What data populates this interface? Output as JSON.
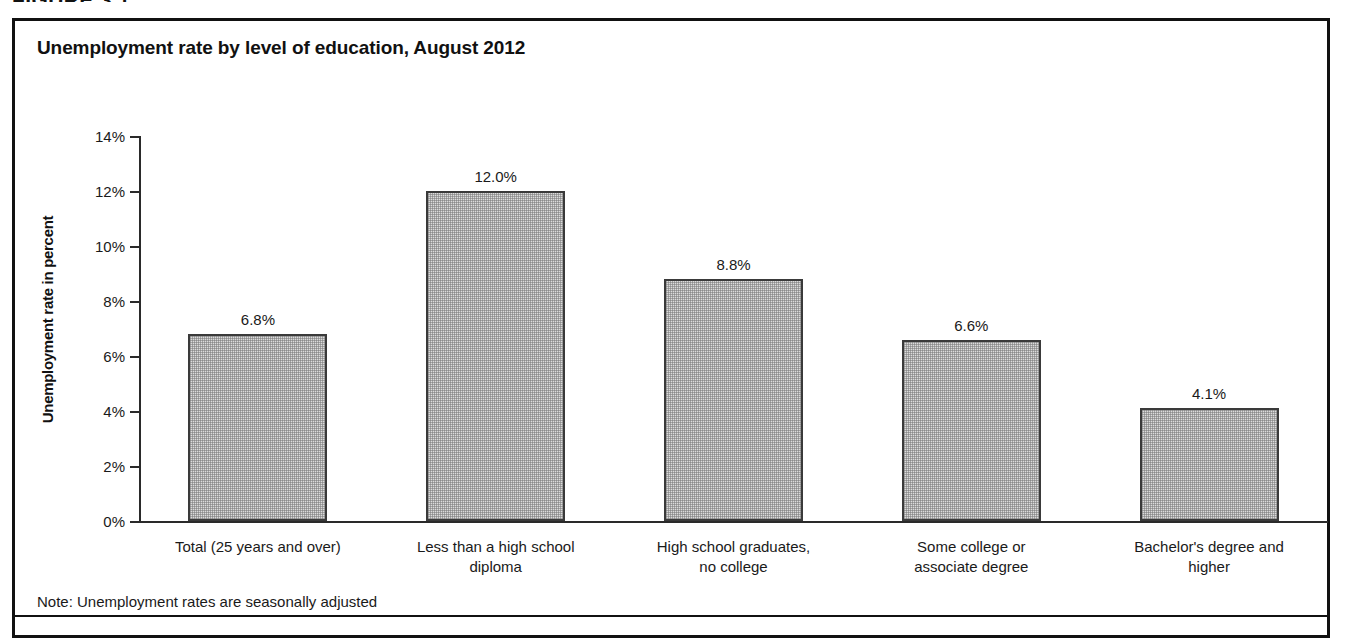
{
  "figure": {
    "caption": "FIGURE 3.1",
    "note": "Note: Unemployment rates are seasonally adjusted"
  },
  "chart_data": {
    "type": "bar",
    "title": "Unemployment rate by level of education, August 2012",
    "xlabel": "",
    "ylabel": "Unemployment rate in percent",
    "ylim": [
      0,
      14
    ],
    "grid": false,
    "legend": null,
    "categories": [
      "Total (25 years and over)",
      "Less than a high school diploma",
      "High school graduates, no college",
      "Some college or associate degree",
      "Bachelor's degree and higher"
    ],
    "category_lines": [
      [
        "Total (25 years and over)"
      ],
      [
        "Less than a high school",
        "diploma"
      ],
      [
        "High school graduates,",
        "no college"
      ],
      [
        "Some college or",
        "associate degree"
      ],
      [
        "Bachelor's degree and",
        "higher"
      ]
    ],
    "values": [
      6.8,
      12.0,
      8.8,
      6.6,
      4.1
    ],
    "data_labels": [
      "6.8%",
      "12.0%",
      "8.8%",
      "6.6%",
      "4.1%"
    ],
    "ytick_values": [
      0,
      2,
      4,
      6,
      8,
      10,
      12,
      14
    ],
    "ytick_labels": [
      "0%",
      "2%",
      "4%",
      "6%",
      "8%",
      "10%",
      "12%",
      "14%"
    ],
    "bar_fill": "#dcdcdc",
    "bar_border": "#3a3a3a",
    "axis_color": "#2a2a2a"
  }
}
